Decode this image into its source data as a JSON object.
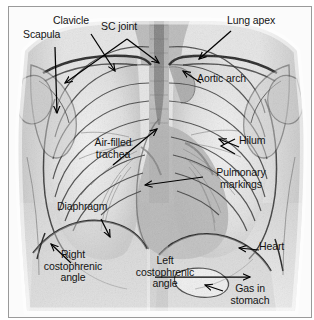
{
  "figure": {
    "image_kind": "chest-xray",
    "frame_color": "#9a9a9a",
    "background_color": "#ffffff",
    "label_color": "#141414",
    "annotation_line_color": "#000000"
  },
  "labels": [
    {
      "id": "scapula",
      "text": "Scapula",
      "x": 14,
      "y": 28,
      "align": "left"
    },
    {
      "id": "clavicle",
      "text": "Clavicle",
      "x": 44,
      "y": 14,
      "align": "left"
    },
    {
      "id": "sc-joint",
      "text": "SC joint",
      "x": 92,
      "y": 20,
      "align": "left"
    },
    {
      "id": "lung-apex",
      "text": "Lung apex",
      "x": 222,
      "y": 14,
      "align": "left"
    },
    {
      "id": "aortic-arch",
      "text": "Aortic arch",
      "x": 192,
      "y": 72,
      "align": "left"
    },
    {
      "id": "hilum",
      "text": "Hilum",
      "x": 232,
      "y": 136,
      "align": "left"
    },
    {
      "id": "air-filled-trachea",
      "text": "Air-filled\ntrachea",
      "x": 74,
      "y": 136,
      "align": "center"
    },
    {
      "id": "pulmonary-markings",
      "text": "Pulmonary\nmarkings",
      "x": 198,
      "y": 167,
      "align": "center"
    },
    {
      "id": "diaphragm",
      "text": "Diaphragm",
      "x": 56,
      "y": 202,
      "align": "left"
    },
    {
      "id": "heart",
      "text": "Heart",
      "x": 254,
      "y": 240,
      "align": "left"
    },
    {
      "id": "right-costophrenic",
      "text": "Right\ncostophrenic\nangle",
      "x": 43,
      "y": 253,
      "align": "center"
    },
    {
      "id": "left-costophrenic",
      "text": "Left\ncostophrenic\nangle",
      "x": 153,
      "y": 259,
      "align": "center"
    },
    {
      "id": "gas-in-stomach",
      "text": "Gas in\nstomach",
      "x": 228,
      "y": 283,
      "align": "center"
    }
  ],
  "leaders": [
    {
      "id": "leader-scapula",
      "label": "Scapula",
      "points": "46,40 48,104",
      "arrow": "down"
    },
    {
      "id": "leader-clavicle",
      "label": "Clavicle",
      "points": "82,27 104,62",
      "arrow": "downright"
    },
    {
      "id": "leader-sc-joint-a",
      "label": "SC joint",
      "points": "118,32 148,55",
      "arrow": "downright"
    },
    {
      "id": "leader-sc-joint-b",
      "label": "SC joint",
      "points": "118,32 57,74",
      "arrow": "downleft"
    },
    {
      "id": "leader-lung-apex",
      "label": "Lung apex",
      "points": "222,24 192,52",
      "arrow": "downleft"
    },
    {
      "id": "leader-aortic-arch",
      "label": "Aortic arch",
      "points": "190,76 173,64",
      "arrow": "upleft"
    },
    {
      "id": "leader-hilum",
      "label": "Hilum",
      "points": "228,140 212,133",
      "arrow": "left"
    },
    {
      "id": "leader-air-trachea",
      "label": "Air-filled trachea",
      "points": "104,158 148,121",
      "arrow": "upright"
    },
    {
      "id": "leader-pulmonary-markings",
      "label": "Pulmonary markings",
      "points": "194,170 138,178",
      "arrow": "left"
    },
    {
      "id": "leader-diaphragm",
      "label": "Diaphragm",
      "points": "92,212 100,228",
      "arrow": "downright"
    },
    {
      "id": "leader-heart",
      "label": "Heart",
      "points": "250,243 232,241",
      "arrow": "left"
    },
    {
      "id": "leader-right-costophrenic",
      "label": "Right costophrenic",
      "points": "60,256 44,238",
      "arrow": "upleft"
    },
    {
      "id": "leader-left-costophrenic",
      "label": "Left costophrenic",
      "points": "146,270 239,270",
      "arrow": "right"
    },
    {
      "id": "leader-gas-stomach",
      "label": "Gas in stomach",
      "points": "214,284 198,279",
      "arrow": "left"
    }
  ],
  "anatomy": {
    "structures": [
      "right lung field",
      "left lung field",
      "rib cage",
      "clavicles",
      "scapulae",
      "trachea",
      "aortic arch",
      "cardiac silhouette",
      "hila",
      "diaphragm",
      "costophrenic angles",
      "gastric air bubble",
      "thoracic spine"
    ]
  }
}
